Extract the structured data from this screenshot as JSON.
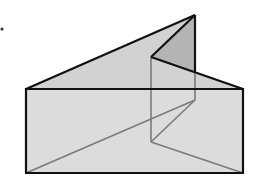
{
  "diagram": {
    "type": "triangular-prism",
    "background": "#ffffff",
    "colors": {
      "fill_light": "#dcdcdc",
      "fill_dark": "#b4b4b4",
      "edge": "#111111",
      "hidden_edge": "#7a7a7a",
      "dot": "#333333"
    },
    "vertices": {
      "front_bottom_left": [
        26,
        173
      ],
      "front_bottom_right": [
        243,
        173
      ],
      "front_top_left": [
        26,
        89
      ],
      "front_top_right": [
        243,
        89
      ],
      "apex_back": [
        195,
        15
      ],
      "apex_inner": [
        151,
        57
      ],
      "hidden_back": [
        195,
        100
      ],
      "inner_low": [
        151,
        142
      ]
    },
    "marker_dot": [
      2,
      29
    ]
  }
}
